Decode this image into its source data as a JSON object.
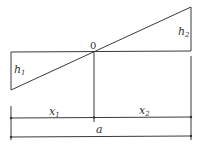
{
  "diagram": {
    "type": "linear-gradient-profile",
    "origin_label": "0",
    "labels": {
      "h1": {
        "base": "h",
        "sub": "1"
      },
      "h2": {
        "base": "h",
        "sub": "2"
      },
      "x1": {
        "base": "x",
        "sub": "1"
      },
      "x2": {
        "base": "x",
        "sub": "2"
      },
      "a": {
        "base": "a"
      }
    },
    "line_color": "#3a3a3a"
  }
}
